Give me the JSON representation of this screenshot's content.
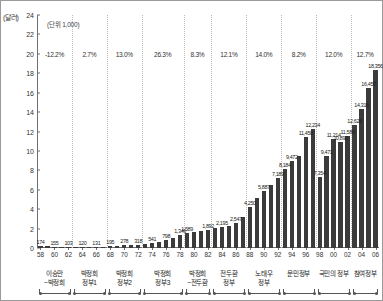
{
  "axis": {
    "y_unit_label": "(달러)",
    "unit_note": "(단위 1,000)",
    "y_ticks": [
      "24",
      "22",
      "20",
      "18",
      "16",
      "14",
      "12",
      "10",
      "8",
      "6",
      "4",
      "2",
      "0"
    ],
    "y_max": 24,
    "y_min": 0
  },
  "chart_data": {
    "type": "bar",
    "title": "",
    "subtitle": "(단위 1,000)",
    "xlabel": "",
    "ylabel": "(달러)",
    "ylim": [
      0,
      24
    ],
    "grid": false,
    "legend": "none",
    "value_scale": "thousand dollars (bar labels are raw dollars)",
    "categories": [
      "58",
      "59",
      "60",
      "61",
      "62",
      "63",
      "64",
      "65",
      "66",
      "67",
      "68",
      "69",
      "70",
      "71",
      "72",
      "73",
      "74",
      "75",
      "76",
      "77",
      "78",
      "79",
      "80",
      "81",
      "82",
      "83",
      "84",
      "85",
      "86",
      "87",
      "88",
      "89",
      "90",
      "91",
      "92",
      "93",
      "94",
      "95",
      "96",
      "97",
      "98",
      "99",
      "00",
      "01",
      "02",
      "03",
      "04",
      "05",
      "06"
    ],
    "tick_labels": [
      "58",
      "60",
      "62",
      "64",
      "66",
      "68",
      "70",
      "72",
      "74",
      "76",
      "78",
      "80",
      "82",
      "84",
      "86",
      "88",
      "90",
      "92",
      "94",
      "96",
      "98",
      "00",
      "02",
      "04",
      "06"
    ],
    "values": [
      174,
      168,
      155,
      132,
      103,
      112,
      120,
      126,
      131,
      150,
      169,
      195,
      278,
      300,
      318,
      410,
      541,
      610,
      798,
      1020,
      1346,
      1589,
      1645,
      1750,
      1892,
      2020,
      2195,
      2300,
      2547,
      3200,
      4250,
      5185,
      5887,
      6500,
      7189,
      8184,
      8984,
      9472,
      11450,
      12234,
      7354,
      9471,
      11214,
      10890,
      11589,
      12626,
      14316,
      16457,
      18356
    ],
    "bar_value_labels": [
      {
        "category": "58",
        "label": "174"
      },
      {
        "category": "60",
        "label": "155"
      },
      {
        "category": "62",
        "label": "103"
      },
      {
        "category": "64",
        "label": "120"
      },
      {
        "category": "66",
        "label": "131"
      },
      {
        "category": "68",
        "label": "195"
      },
      {
        "category": "70",
        "label": "278"
      },
      {
        "category": "72",
        "label": "318"
      },
      {
        "category": "74",
        "label": "541"
      },
      {
        "category": "76",
        "label": "798"
      },
      {
        "category": "78",
        "label": "1,346"
      },
      {
        "category": "79",
        "label": "1,589"
      },
      {
        "category": "82",
        "label": "1,892"
      },
      {
        "category": "84",
        "label": "2,195"
      },
      {
        "category": "86",
        "label": "2,547"
      },
      {
        "category": "88",
        "label": "4,250"
      },
      {
        "category": "90",
        "label": "5,887"
      },
      {
        "category": "92",
        "label": "7,189"
      },
      {
        "category": "93",
        "label": "8,184"
      },
      {
        "category": "94",
        "label": "9,472"
      },
      {
        "category": "96",
        "label": "11,450"
      },
      {
        "category": "97",
        "label": "12,234"
      },
      {
        "category": "98",
        "label": "7,354"
      },
      {
        "category": "99",
        "label": "9,471"
      },
      {
        "category": "00",
        "label": "11,214"
      },
      {
        "category": "01",
        "label": "10,890"
      },
      {
        "category": "02",
        "label": "11,589"
      },
      {
        "category": "03",
        "label": "12,626"
      },
      {
        "category": "04",
        "label": "14,316"
      },
      {
        "category": "05",
        "label": "16,457"
      },
      {
        "category": "06",
        "label": "18,356"
      }
    ],
    "annotations": [
      {
        "type": "growth_rate",
        "group": "이승만~박정희",
        "value": "-12.2%"
      },
      {
        "type": "growth_rate",
        "group": "박정희 정부1",
        "value": "2.7%"
      },
      {
        "type": "growth_rate",
        "group": "박정희 정부2",
        "value": "13.0%"
      },
      {
        "type": "growth_rate",
        "group": "박정희 정부3",
        "value": "26.3%"
      },
      {
        "type": "growth_rate",
        "group": "박정희~전두환",
        "value": "8.3%"
      },
      {
        "type": "growth_rate",
        "group": "전두환 정부",
        "value": "12.1%"
      },
      {
        "type": "growth_rate",
        "group": "노태우 정부",
        "value": "14.0%"
      },
      {
        "type": "growth_rate",
        "group": "문민정부",
        "value": "8.2%"
      },
      {
        "type": "growth_rate",
        "group": "국민의 정부",
        "value": "12.0%"
      },
      {
        "type": "growth_rate",
        "group": "참여정부",
        "value": "12.7%"
      }
    ],
    "era_groups": [
      {
        "name_line1": "이승만",
        "name_line2": "~박정희",
        "start": "58",
        "end": "62",
        "growth": "-12.2%"
      },
      {
        "name_line1": "박정희",
        "name_line2": "정부1",
        "start": "63",
        "end": "67",
        "growth": "2.7%"
      },
      {
        "name_line1": "박정희",
        "name_line2": "정부2",
        "start": "68",
        "end": "72",
        "growth": "13.0%"
      },
      {
        "name_line1": "박정희",
        "name_line2": "정부3",
        "start": "73",
        "end": "78",
        "growth": "26.3%"
      },
      {
        "name_line1": "박정희",
        "name_line2": "~전두환",
        "start": "79",
        "end": "82",
        "growth": "8.3%"
      },
      {
        "name_line1": "전두환",
        "name_line2": "정부",
        "start": "83",
        "end": "87",
        "growth": "12.1%"
      },
      {
        "name_line1": "노태우",
        "name_line2": "정부",
        "start": "88",
        "end": "92",
        "growth": "14.0%"
      },
      {
        "name_line1": "문민정부",
        "name_line2": "",
        "start": "93",
        "end": "97",
        "growth": "8.2%"
      },
      {
        "name_line1": "국민의 정부",
        "name_line2": "",
        "start": "98",
        "end": "02",
        "growth": "12.0%"
      },
      {
        "name_line1": "참여정부",
        "name_line2": "",
        "start": "03",
        "end": "06",
        "growth": "12.7%"
      }
    ],
    "colors": {
      "bar": "#3b3b3b",
      "axis": "#6f6f6f",
      "separator": "#bdbdbd",
      "text": "#222222",
      "background": "#ffffff",
      "border": "#9a9a9a"
    }
  }
}
